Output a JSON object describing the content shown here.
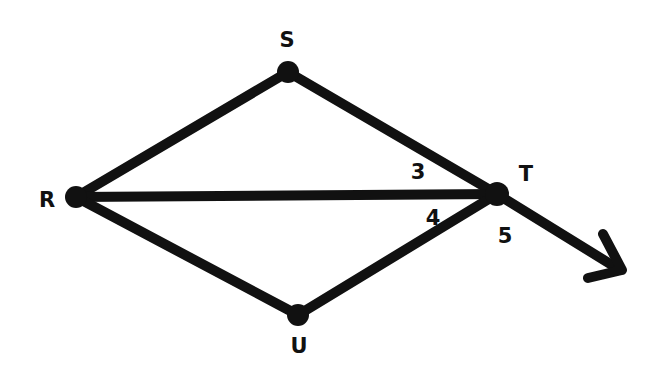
{
  "diagram": {
    "type": "geometry-figure",
    "stroke_color": "#111111",
    "background": "#ffffff",
    "points": [
      {
        "id": "R",
        "label": "R",
        "x": 76,
        "y": 197,
        "label_x": 47,
        "label_y": 200
      },
      {
        "id": "S",
        "label": "S",
        "x": 288,
        "y": 72,
        "label_x": 287,
        "label_y": 40
      },
      {
        "id": "T",
        "label": "T",
        "x": 497,
        "y": 194,
        "label_x": 526,
        "label_y": 174
      },
      {
        "id": "U",
        "label": "U",
        "x": 298,
        "y": 315,
        "label_x": 299,
        "label_y": 346
      }
    ],
    "segments": [
      {
        "name": "RS",
        "from": "R",
        "to": "S"
      },
      {
        "name": "ST",
        "from": "S",
        "to": "T"
      },
      {
        "name": "RT",
        "from": "R",
        "to": "T"
      },
      {
        "name": "RU",
        "from": "R",
        "to": "U"
      },
      {
        "name": "UT",
        "from": "U",
        "to": "T"
      }
    ],
    "ray": {
      "name": "ray-from-T",
      "from": "T",
      "to_x": 620,
      "to_y": 270
    },
    "angle_labels": [
      {
        "label": "3",
        "x": 418,
        "y": 172
      },
      {
        "label": "4",
        "x": 433,
        "y": 218
      },
      {
        "label": "5",
        "x": 505,
        "y": 236
      }
    ]
  }
}
